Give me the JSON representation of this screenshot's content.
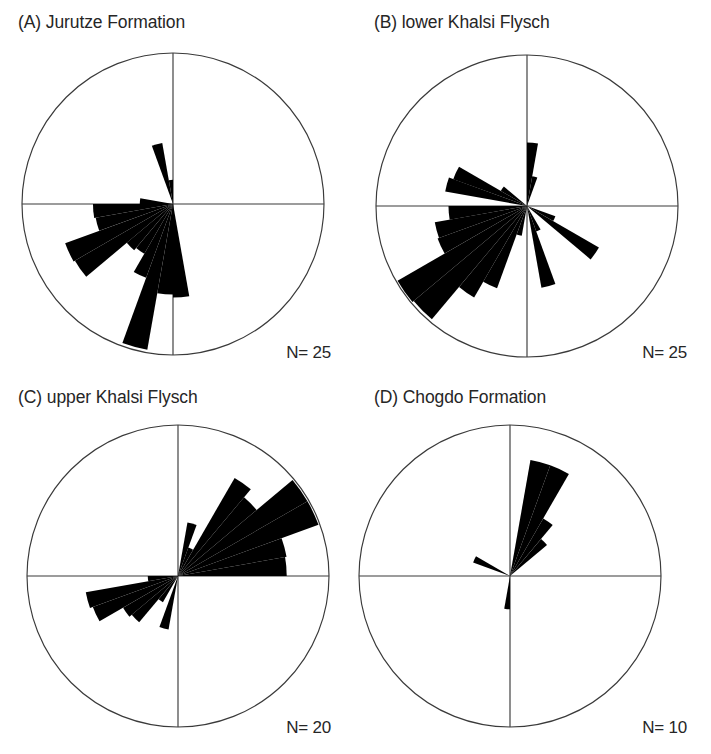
{
  "figure": {
    "caption_style": "four rose diagrams of paleocurrent directions",
    "background_color": "#ffffff",
    "petal_color": "#000000",
    "outline_color": "#3a3a3a"
  },
  "panels": [
    {
      "id": "A",
      "title": "(A) Jurutze Formation",
      "n_label": "N= 25",
      "n_value": 25,
      "center": {
        "x": 173,
        "y": 204
      },
      "radius": 151
    },
    {
      "id": "B",
      "title": "(B) lower Khalsi Flysch",
      "n_label": "N= 25",
      "n_value": 25,
      "center": {
        "x": 171,
        "y": 206
      },
      "radius": 151
    },
    {
      "id": "C",
      "title": "(C) upper Khalsi Flysch",
      "n_label": "N= 20",
      "n_value": 20,
      "center": {
        "x": 178,
        "y": 201
      },
      "radius": 151
    },
    {
      "id": "D",
      "title": "(D) Chogdo Formation",
      "n_label": "N= 10",
      "n_value": 10,
      "center": {
        "x": 154,
        "y": 201
      },
      "radius": 151
    }
  ],
  "chart_data": [
    {
      "type": "rose",
      "panel": "A",
      "title": "(A) Jurutze Formation",
      "n": 25,
      "bin_width_deg": 10,
      "r_max": 1.0,
      "note": "azimuth measured clockwise from north (up); radius fraction of circle radius",
      "petals": [
        {
          "azimuth_deg": 345,
          "width_deg": 10,
          "r": 0.41
        },
        {
          "azimuth_deg": 355,
          "width_deg": 10,
          "r": 0.16
        },
        {
          "azimuth_deg": 175,
          "width_deg": 10,
          "r": 0.62
        },
        {
          "azimuth_deg": 185,
          "width_deg": 10,
          "r": 0.6
        },
        {
          "azimuth_deg": 195,
          "width_deg": 10,
          "r": 0.98
        },
        {
          "azimuth_deg": 205,
          "width_deg": 10,
          "r": 0.52
        },
        {
          "azimuth_deg": 215,
          "width_deg": 10,
          "r": 0.38
        },
        {
          "azimuth_deg": 225,
          "width_deg": 10,
          "r": 0.4
        },
        {
          "azimuth_deg": 235,
          "width_deg": 10,
          "r": 0.75
        },
        {
          "azimuth_deg": 245,
          "width_deg": 10,
          "r": 0.76
        },
        {
          "azimuth_deg": 255,
          "width_deg": 10,
          "r": 0.52
        },
        {
          "azimuth_deg": 265,
          "width_deg": 10,
          "r": 0.53
        },
        {
          "azimuth_deg": 275,
          "width_deg": 10,
          "r": 0.22
        }
      ]
    },
    {
      "type": "rose",
      "panel": "B",
      "title": "(B) lower Khalsi Flysch",
      "n": 25,
      "bin_width_deg": 10,
      "r_max": 1.0,
      "petals": [
        {
          "azimuth_deg": 5,
          "width_deg": 10,
          "r": 0.42
        },
        {
          "azimuth_deg": 15,
          "width_deg": 10,
          "r": 0.2
        },
        {
          "azimuth_deg": 115,
          "width_deg": 10,
          "r": 0.2
        },
        {
          "azimuth_deg": 125,
          "width_deg": 10,
          "r": 0.55
        },
        {
          "azimuth_deg": 155,
          "width_deg": 10,
          "r": 0.18
        },
        {
          "azimuth_deg": 165,
          "width_deg": 10,
          "r": 0.55
        },
        {
          "azimuth_deg": 195,
          "width_deg": 10,
          "r": 0.2
        },
        {
          "azimuth_deg": 205,
          "width_deg": 10,
          "r": 0.58
        },
        {
          "azimuth_deg": 215,
          "width_deg": 10,
          "r": 0.7
        },
        {
          "azimuth_deg": 225,
          "width_deg": 10,
          "r": 0.98
        },
        {
          "azimuth_deg": 235,
          "width_deg": 10,
          "r": 0.99
        },
        {
          "azimuth_deg": 245,
          "width_deg": 10,
          "r": 0.63
        },
        {
          "azimuth_deg": 255,
          "width_deg": 10,
          "r": 0.62
        },
        {
          "azimuth_deg": 265,
          "width_deg": 10,
          "r": 0.52
        },
        {
          "azimuth_deg": 285,
          "width_deg": 10,
          "r": 0.55
        },
        {
          "azimuth_deg": 295,
          "width_deg": 10,
          "r": 0.52
        },
        {
          "azimuth_deg": 305,
          "width_deg": 10,
          "r": 0.2
        }
      ]
    },
    {
      "type": "rose",
      "panel": "C",
      "title": "(C) upper Khalsi Flysch",
      "n": 20,
      "bin_width_deg": 10,
      "r_max": 1.0,
      "petals": [
        {
          "azimuth_deg": 15,
          "width_deg": 10,
          "r": 0.36
        },
        {
          "azimuth_deg": 25,
          "width_deg": 10,
          "r": 0.2
        },
        {
          "azimuth_deg": 35,
          "width_deg": 10,
          "r": 0.75
        },
        {
          "azimuth_deg": 45,
          "width_deg": 10,
          "r": 0.68
        },
        {
          "azimuth_deg": 55,
          "width_deg": 10,
          "r": 0.99
        },
        {
          "azimuth_deg": 65,
          "width_deg": 10,
          "r": 0.99
        },
        {
          "azimuth_deg": 75,
          "width_deg": 10,
          "r": 0.73
        },
        {
          "azimuth_deg": 85,
          "width_deg": 10,
          "r": 0.72
        },
        {
          "azimuth_deg": 195,
          "width_deg": 10,
          "r": 0.36
        },
        {
          "azimuth_deg": 215,
          "width_deg": 10,
          "r": 0.2
        },
        {
          "azimuth_deg": 225,
          "width_deg": 10,
          "r": 0.4
        },
        {
          "azimuth_deg": 235,
          "width_deg": 10,
          "r": 0.42
        },
        {
          "azimuth_deg": 245,
          "width_deg": 10,
          "r": 0.6
        },
        {
          "azimuth_deg": 255,
          "width_deg": 10,
          "r": 0.62
        },
        {
          "azimuth_deg": 265,
          "width_deg": 10,
          "r": 0.2
        }
      ]
    },
    {
      "type": "rose",
      "panel": "D",
      "title": "(D) Chogdo Formation",
      "n": 10,
      "bin_width_deg": 10,
      "r_max": 1.0,
      "petals": [
        {
          "azimuth_deg": 15,
          "width_deg": 10,
          "r": 0.78
        },
        {
          "azimuth_deg": 25,
          "width_deg": 10,
          "r": 0.78
        },
        {
          "azimuth_deg": 35,
          "width_deg": 10,
          "r": 0.44
        },
        {
          "azimuth_deg": 45,
          "width_deg": 10,
          "r": 0.32
        },
        {
          "azimuth_deg": 185,
          "width_deg": 10,
          "r": 0.22
        },
        {
          "azimuth_deg": 295,
          "width_deg": 10,
          "r": 0.26
        }
      ]
    }
  ]
}
